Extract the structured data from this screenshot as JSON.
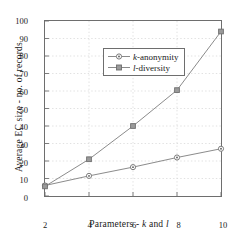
{
  "chart_data": {
    "type": "line",
    "title": "",
    "xlabel": "Parameters - k and l",
    "ylabel": "Average EC size - no. of records",
    "x": [
      2,
      4,
      6,
      8,
      10
    ],
    "xlim": [
      2,
      10
    ],
    "ylim": [
      0,
      100
    ],
    "xticks": [
      "2",
      "4",
      "6",
      "8",
      "10"
    ],
    "yticks": [
      "0",
      "10",
      "20",
      "30",
      "40",
      "50",
      "60",
      "70",
      "80",
      "90",
      "100"
    ],
    "grid": true,
    "legend_position": "upper left",
    "series": [
      {
        "name": "k-anonymity",
        "values": [
          6,
          11.5,
          16.5,
          22,
          27
        ],
        "color": "#808080",
        "marker": "circle-dot"
      },
      {
        "name": "l-diversity",
        "values": [
          5.5,
          21,
          40,
          60.5,
          94
        ],
        "color": "#808080",
        "marker": "square-dot"
      }
    ]
  },
  "legend": {
    "items": [
      {
        "label_prefix": "k",
        "label_rest": "-anonymity"
      },
      {
        "label_prefix": "l",
        "label_rest": "-diversity"
      }
    ]
  },
  "axis_titles": {
    "x_prefix": "Parameters - ",
    "x_k": "k",
    "x_mid": " and ",
    "x_l": "l",
    "y": "Average EC size - no. of records"
  },
  "colors": {
    "axis": "#6e6e6e",
    "grid": "#d9d9d9",
    "line": "#8a8a8a",
    "marker": "#7a7a7a",
    "text": "#1a1a1a"
  }
}
